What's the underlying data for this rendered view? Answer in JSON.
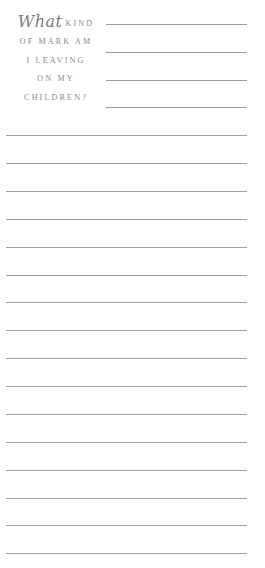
{
  "heading": {
    "script_word": "What",
    "rows": [
      "KIND",
      "OF MARK AM",
      "I LEAVING",
      "ON MY",
      "CHILDREN?"
    ]
  },
  "lines": {
    "short_count": 4,
    "full_count": 16,
    "color": "#a3a3a3"
  }
}
